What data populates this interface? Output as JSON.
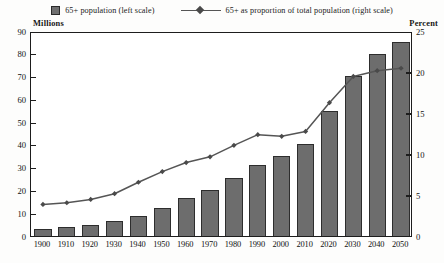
{
  "legend": {
    "bars_label": "65+ population (left scale)",
    "line_label": "65+ as proportion of total population (right scale)",
    "bar_swatch_icon": "filled-square-icon",
    "line_marker_icon": "diamond-marker-icon"
  },
  "axis_captions": {
    "left": "Millions",
    "right": "Percent"
  },
  "chart_data": {
    "type": "bar",
    "title": "",
    "subtitle": "",
    "xlabel": "",
    "ylabel": "Millions",
    "y2label": "Percent",
    "grid": false,
    "legend_position": "top-center",
    "categories": [
      "1900",
      "1910",
      "1920",
      "1930",
      "1940",
      "1950",
      "1960",
      "1970",
      "1980",
      "1990",
      "2000",
      "2010",
      "2020",
      "2030",
      "2040",
      "2050"
    ],
    "ylim": [
      0,
      90
    ],
    "yticks": [
      0,
      10,
      20,
      30,
      40,
      50,
      60,
      70,
      80,
      90
    ],
    "y2lim": [
      0,
      25
    ],
    "y2ticks": [
      0,
      5,
      10,
      15,
      20,
      25
    ],
    "series": [
      {
        "name": "65+ population (left scale)",
        "type": "bar",
        "axis": "left",
        "units": "Millions",
        "color": "#6d6d6d",
        "values": [
          3.1,
          4.0,
          4.9,
          6.7,
          9.0,
          12.3,
          16.6,
          20.1,
          25.5,
          31.2,
          35.0,
          40.2,
          55.0,
          70.3,
          80.1,
          85.0
        ]
      },
      {
        "name": "65+ as proportion of total population (right scale)",
        "type": "line",
        "axis": "right",
        "units": "Percent",
        "color": "#555555",
        "values": [
          4.1,
          4.3,
          4.7,
          5.4,
          6.8,
          8.1,
          9.2,
          9.9,
          11.3,
          12.6,
          12.4,
          13.0,
          16.5,
          19.7,
          20.4,
          20.7
        ]
      }
    ]
  }
}
